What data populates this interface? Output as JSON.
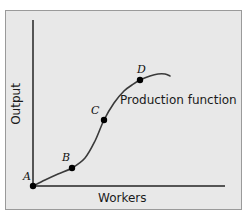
{
  "figure": {
    "background_color": "#e8e8e8",
    "frame_border_color": "#9a9a9a",
    "axis_color": "#555555",
    "curve_color": "#3a3a3a",
    "point_color": "#000000",
    "curve_label": "Production function",
    "axes": {
      "ylabel": "Output",
      "xlabel": "Workers"
    },
    "points": [
      {
        "label": "A",
        "x": 33,
        "y": 186,
        "label_dx": -10,
        "label_dy": -16
      },
      {
        "label": "B",
        "x": 72,
        "y": 168,
        "label_dx": -10,
        "label_dy": -17
      },
      {
        "label": "C",
        "x": 104,
        "y": 120,
        "label_dx": -13,
        "label_dy": -16
      },
      {
        "label": "D",
        "x": 140,
        "y": 80,
        "label_dx": -3,
        "label_dy": -17
      }
    ]
  },
  "chart_data": {
    "type": "line",
    "title": "",
    "xlabel": "Workers",
    "ylabel": "Output",
    "grid": false,
    "legend": false,
    "annotations": [
      {
        "text": "Production function",
        "x": 120,
        "y": 104
      }
    ],
    "series": [
      {
        "name": "Production function",
        "description": "S-shaped total product curve: increasing marginal returns from A to C, diminishing marginal returns after C, with a maximum near the right end.",
        "x": [
          33,
          45,
          58,
          72,
          85,
          95,
          104,
          114,
          124,
          132,
          140,
          150,
          158,
          165,
          170
        ],
        "y": [
          186,
          180,
          174,
          168,
          158,
          141,
          120,
          103,
          91,
          85,
          80,
          76,
          74,
          74,
          76
        ]
      }
    ],
    "labeled_points": [
      {
        "label": "A",
        "x": 33,
        "y": 186
      },
      {
        "label": "B",
        "x": 72,
        "y": 168
      },
      {
        "label": "C",
        "x": 104,
        "y": 120
      },
      {
        "label": "D",
        "x": 140,
        "y": 80
      }
    ],
    "axis_pixel_ranges": {
      "x_axis_y": 186,
      "x_axis_from": 33,
      "x_axis_to": 225,
      "y_axis_x": 33,
      "y_axis_from": 20,
      "y_axis_to": 186
    }
  }
}
